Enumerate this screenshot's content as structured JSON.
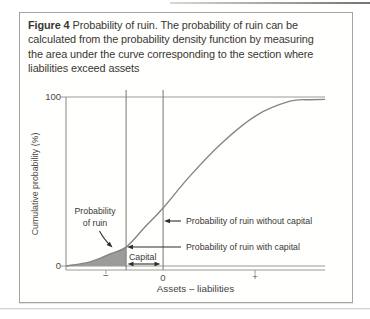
{
  "figure": {
    "caption_label": "Figure 4",
    "caption_text": "Probability of ruin. The probability of ruin can be\ncalculated from the probability density function by measuring\nthe area under the curve corresponding to the section where\nliabilities exceed assets"
  },
  "chart_data": {
    "type": "line",
    "title": "",
    "xlabel": "Assets – liabilities",
    "ylabel": "Cumulative probability (%)",
    "ylim": [
      0,
      100
    ],
    "grid": false,
    "legend": "none",
    "y_tick_labels": [
      "0",
      "100"
    ],
    "x_tick_labels": [
      "−",
      "0",
      "+"
    ],
    "x_tick_fractions": [
      0.154,
      0.375,
      0.73
    ],
    "reference_lines": {
      "capital_line_fraction": 0.232,
      "zero_line_fraction": 0.375
    },
    "series": [
      {
        "name": "Cumulative probability of (assets − liabilities)",
        "points": [
          [
            0,
            0
          ],
          [
            0.093,
            2.4
          ],
          [
            0.17,
            7.1
          ],
          [
            0.232,
            11.2
          ],
          [
            0.305,
            23.1
          ],
          [
            0.375,
            34.3
          ],
          [
            0.479,
            53.3
          ],
          [
            0.606,
            73.4
          ],
          [
            0.737,
            89.3
          ],
          [
            0.865,
            97.5
          ],
          [
            0.942,
            98.4
          ],
          [
            1,
            98.6
          ]
        ]
      }
    ],
    "key_values": {
      "probability_of_ruin_with_capital_pct": 11,
      "probability_of_ruin_without_capital_pct": 34
    },
    "shaded_region": "area under curve left of capital line (probability of ruin)",
    "annotations": {
      "probability_of_ruin": "Probability\nof ruin",
      "capital": "Capital",
      "without_capital": "Probability of ruin without capital",
      "with_capital": "Probability of ruin with capital"
    },
    "colors": {
      "line": "#86867f",
      "axis": "#9a9a95",
      "refline": "#82827c",
      "fill": "#9c9c98",
      "arrow": "#2f2d2a",
      "text": "#3b3935"
    }
  }
}
